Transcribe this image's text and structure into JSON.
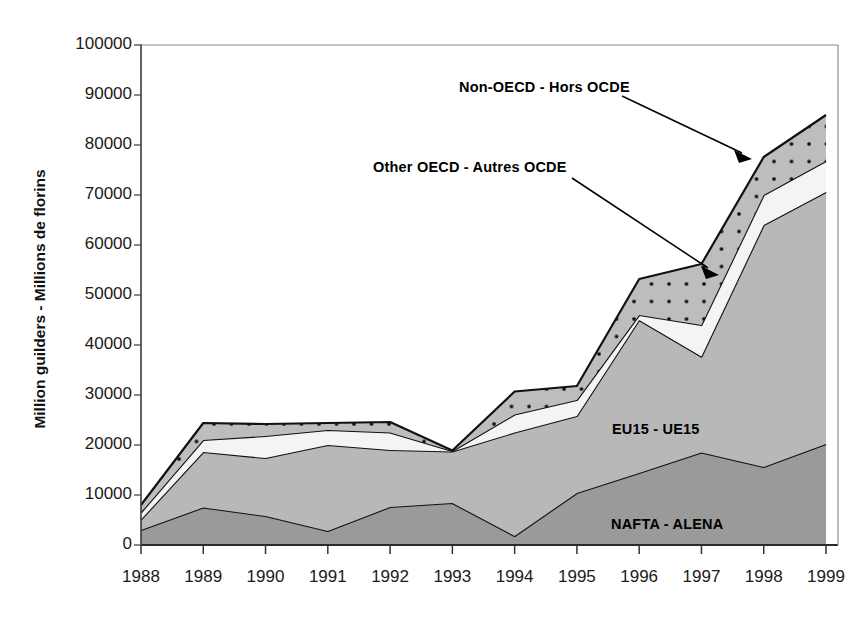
{
  "chart_data": {
    "type": "area",
    "stacked": true,
    "title": "",
    "xlabel": "",
    "ylabel": "Million guilders - Millions de florins",
    "x": [
      1988,
      1989,
      1990,
      1991,
      1992,
      1993,
      1994,
      1995,
      1996,
      1997,
      1998,
      1999
    ],
    "categories": [
      "1988",
      "1989",
      "1990",
      "1991",
      "1992",
      "1993",
      "1994",
      "1995",
      "1996",
      "1997",
      "1998",
      "1999"
    ],
    "ylim": [
      0,
      100000
    ],
    "yticks": [
      0,
      10000,
      20000,
      30000,
      40000,
      50000,
      60000,
      70000,
      80000,
      90000,
      100000
    ],
    "ytick_labels": [
      "0",
      "10000",
      "20000",
      "30000",
      "40000",
      "50000",
      "60000",
      "70000",
      "80000",
      "90000",
      "100000"
    ],
    "grid": false,
    "legend_position": "inline-annotations",
    "series": [
      {
        "name": "NAFTA - ALENA",
        "fill": "#9a9a9a",
        "pattern": "solid",
        "values": [
          3000,
          7500,
          5800,
          2800,
          7600,
          8400,
          1800,
          10400,
          14400,
          18500,
          15600,
          20200
        ]
      },
      {
        "name": "EU15 - UE15",
        "fill": "#b8b8b8",
        "pattern": "solid",
        "values": [
          2100,
          11100,
          11600,
          17200,
          11400,
          10300,
          20700,
          15400,
          30600,
          19200,
          48400,
          50400
        ]
      },
      {
        "name": "Other OECD - Autres OCDE",
        "fill": "#f4f4f4",
        "pattern": "solid",
        "values": [
          1400,
          2400,
          4400,
          3000,
          3500,
          100,
          3600,
          3200,
          1000,
          6300,
          6000,
          6200
        ]
      },
      {
        "name": "Non-OECD - Hors OCDE",
        "fill": "#bdbdbd",
        "pattern": "dotted",
        "values": [
          1500,
          3400,
          2400,
          1400,
          2100,
          100,
          4600,
          2800,
          7200,
          12200,
          7600,
          9200
        ]
      }
    ],
    "stack_tops": {
      "NAFTA - ALENA": [
        3000,
        7500,
        5800,
        2800,
        7600,
        8400,
        1800,
        10400,
        14400,
        18500,
        15600,
        20200
      ],
      "EU15 - UE15": [
        5100,
        18600,
        17400,
        20000,
        19000,
        18700,
        22500,
        25800,
        45000,
        37700,
        64000,
        70600
      ],
      "Other OECD - Autres OCDE": [
        6500,
        21000,
        21800,
        23000,
        22500,
        18800,
        26100,
        29000,
        46000,
        44000,
        70000,
        76800
      ],
      "Non-OECD - Hors OCDE": [
        8000,
        24400,
        24200,
        24400,
        24600,
        18900,
        30700,
        31800,
        53200,
        56200,
        77600,
        86000
      ]
    },
    "annotations": [
      {
        "text": "Non-OECD - Hors OCDE",
        "points_to": "Non-OECD band near 1998"
      },
      {
        "text": "Other OECD - Autres OCDE",
        "points_to": "Other OECD white band near 1997"
      },
      {
        "text": "EU15 - UE15",
        "points_to": "EU15 area"
      },
      {
        "text": "NAFTA - ALENA",
        "points_to": "NAFTA area"
      }
    ],
    "colors": {
      "nafta": "#9a9a9a",
      "eu15": "#b8b8b8",
      "other_oecd": "#f4f4f4",
      "non_oecd": "#bdbdbd",
      "line": "#111111",
      "axis": "#444444"
    }
  },
  "axes": {
    "y_title": "Million guilders - Millions de florins",
    "y_tick_labels": [
      "100000",
      "90000",
      "80000",
      "70000",
      "60000",
      "50000",
      "40000",
      "30000",
      "20000",
      "10000",
      "0"
    ],
    "x_tick_labels": [
      "1988",
      "1989",
      "1990",
      "1991",
      "1992",
      "1993",
      "1994",
      "1995",
      "1996",
      "1997",
      "1998",
      "1999"
    ]
  },
  "annotations": {
    "non_oecd": "Non-OECD - Hors OCDE",
    "other_oecd": "Other OECD - Autres OCDE",
    "eu15": "EU15 - UE15",
    "nafta": "NAFTA - ALENA"
  },
  "top_text": ""
}
